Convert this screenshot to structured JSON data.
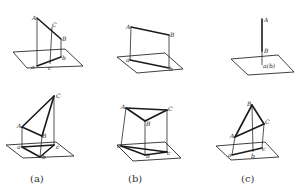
{
  "figure": {
    "width": 295,
    "height": 194,
    "background": "#ffffff",
    "ink_color": "#1a1a1a",
    "captions": [
      {
        "id": "a",
        "text": "(a)",
        "x": 30,
        "y": 182
      },
      {
        "id": "b",
        "text": "(b)",
        "x": 128,
        "y": 182
      },
      {
        "id": "c",
        "text": "(c)",
        "x": 241,
        "y": 182
      }
    ],
    "panels": [
      {
        "id": "top-a",
        "description": "Line AB with point C on it, projected onto horizontal plane as ab with c",
        "plane": [
          [
            13,
            52
          ],
          [
            65,
            49
          ],
          [
            83,
            66
          ],
          [
            27,
            68
          ]
        ],
        "edges": [
          [
            [
              37,
              18
            ],
            [
              61,
              39
            ]
          ],
          [
            [
              37,
              66
            ],
            [
              61,
              57
            ]
          ]
        ],
        "projectors": [
          [
            [
              37,
              18
            ],
            [
              37,
              66
            ]
          ],
          [
            [
              52,
              27
            ],
            [
              50,
              64
            ]
          ],
          [
            [
              61,
              39
            ],
            [
              61,
              57
            ]
          ]
        ],
        "labels": [
          {
            "text": "A",
            "x": 32,
            "y": 20
          },
          {
            "text": "C",
            "x": 52,
            "y": 27
          },
          {
            "text": "B",
            "x": 62,
            "y": 41
          },
          {
            "text": "a",
            "x": 31,
            "y": 69
          },
          {
            "text": "c",
            "x": 48,
            "y": 70
          },
          {
            "text": "b",
            "x": 62,
            "y": 60
          }
        ]
      },
      {
        "id": "top-b",
        "description": "Line AB and its projection ab",
        "plane": [
          [
            117,
            57
          ],
          [
            165,
            53
          ],
          [
            183,
            69
          ],
          [
            137,
            73
          ]
        ],
        "edges": [
          [
            [
              131,
              27
            ],
            [
              169,
              35
            ]
          ],
          [
            [
              130,
              60
            ],
            [
              169,
              68
            ]
          ]
        ],
        "projectors": [
          [
            [
              131,
              27
            ],
            [
              130,
              60
            ]
          ],
          [
            [
              169,
              35
            ],
            [
              169,
              68
            ]
          ]
        ],
        "labels": [
          {
            "text": "A",
            "x": 126,
            "y": 29
          },
          {
            "text": "B",
            "x": 170,
            "y": 37
          },
          {
            "text": "a",
            "x": 126,
            "y": 62
          },
          {
            "text": "b",
            "x": 169,
            "y": 71
          }
        ]
      },
      {
        "id": "top-c",
        "description": "Vertical line AB projecting to a single point a(b)",
        "plane": [
          [
            231,
            59
          ],
          [
            278,
            55
          ],
          [
            294,
            72
          ],
          [
            248,
            75
          ]
        ],
        "edges": [
          [
            [
              262,
              19
            ],
            [
              262,
              51
            ]
          ]
        ],
        "projectors": [
          [
            [
              262,
              51
            ],
            [
              262,
              65
            ]
          ]
        ],
        "labels": [
          {
            "text": "A",
            "x": 264,
            "y": 22
          },
          {
            "text": "B",
            "x": 264,
            "y": 53
          },
          {
            "text": "a(b)",
            "x": 263,
            "y": 68
          }
        ]
      },
      {
        "id": "bottom-a",
        "description": "Triangle ABC and its projection abc",
        "plane": [
          [
            6,
            145
          ],
          [
            56,
            142
          ],
          [
            74,
            156
          ],
          [
            23,
            158
          ]
        ],
        "edges": [
          [
            [
              54,
              96
            ],
            [
              22,
              127
            ]
          ],
          [
            [
              22,
              127
            ],
            [
              42,
              136
            ]
          ],
          [
            [
              42,
              136
            ],
            [
              54,
              96
            ]
          ],
          [
            [
              22,
              147
            ],
            [
              40,
              157
            ]
          ],
          [
            [
              40,
              157
            ],
            [
              54,
              145
            ]
          ],
          [
            [
              54,
              145
            ],
            [
              22,
              147
            ]
          ]
        ],
        "projectors": [
          [
            [
              22,
              127
            ],
            [
              22,
              147
            ]
          ],
          [
            [
              42,
              136
            ],
            [
              40,
              157
            ]
          ],
          [
            [
              54,
              96
            ],
            [
              54,
              145
            ]
          ]
        ],
        "labels": [
          {
            "text": "C",
            "x": 56,
            "y": 98
          },
          {
            "text": "A",
            "x": 17,
            "y": 128
          },
          {
            "text": "B",
            "x": 42,
            "y": 138
          },
          {
            "text": "a",
            "x": 17,
            "y": 149
          },
          {
            "text": "c",
            "x": 56,
            "y": 149
          },
          {
            "text": "b",
            "x": 42,
            "y": 159
          }
        ]
      },
      {
        "id": "bottom-b",
        "description": "Triangle ABC parallel to the plane, projection abc",
        "plane": [
          [
            117,
            145
          ],
          [
            165,
            142
          ],
          [
            181,
            158
          ],
          [
            133,
            161
          ]
        ],
        "edges": [
          [
            [
              126,
              108
            ],
            [
              167,
              110
            ]
          ],
          [
            [
              126,
              108
            ],
            [
              145,
              121
            ]
          ],
          [
            [
              145,
              121
            ],
            [
              167,
              110
            ]
          ],
          [
            [
              121,
              146
            ],
            [
              145,
              155
            ]
          ],
          [
            [
              145,
              155
            ],
            [
              167,
              152
            ]
          ],
          [
            [
              121,
              146
            ],
            [
              167,
              152
            ]
          ]
        ],
        "projectors": [
          [
            [
              126,
              108
            ],
            [
              121,
              146
            ]
          ],
          [
            [
              145,
              121
            ],
            [
              145,
              155
            ]
          ],
          [
            [
              167,
              110
            ],
            [
              167,
              152
            ]
          ]
        ],
        "labels": [
          {
            "text": "A",
            "x": 121,
            "y": 109
          },
          {
            "text": "C",
            "x": 168,
            "y": 111
          },
          {
            "text": "B",
            "x": 146,
            "y": 126
          },
          {
            "text": "a",
            "x": 117,
            "y": 148
          },
          {
            "text": "b",
            "x": 146,
            "y": 158
          },
          {
            "text": "c",
            "x": 167,
            "y": 155
          }
        ]
      },
      {
        "id": "bottom-c",
        "description": "Triangle ABC perpendicular to the plane, projecting to line abc",
        "plane": [
          [
            216,
            146
          ],
          [
            265,
            142
          ],
          [
            279,
            157
          ],
          [
            231,
            160
          ]
        ],
        "edges": [
          [
            [
              252,
              105
            ],
            [
              235,
              137
            ]
          ],
          [
            [
              235,
              137
            ],
            [
              264,
              124
            ]
          ],
          [
            [
              264,
              124
            ],
            [
              252,
              105
            ]
          ],
          [
            [
              232,
              155
            ],
            [
              262,
              148
            ]
          ]
        ],
        "projectors": [
          [
            [
              235,
              137
            ],
            [
              232,
              155
            ]
          ],
          [
            [
              252,
              105
            ],
            [
              253,
              152
            ]
          ],
          [
            [
              264,
              124
            ],
            [
              262,
              148
            ]
          ]
        ],
        "labels": [
          {
            "text": "B",
            "x": 247,
            "y": 106
          },
          {
            "text": "C",
            "x": 265,
            "y": 124
          },
          {
            "text": "A",
            "x": 230,
            "y": 138
          },
          {
            "text": "a",
            "x": 228,
            "y": 157
          },
          {
            "text": "b",
            "x": 251,
            "y": 158
          },
          {
            "text": "c",
            "x": 262,
            "y": 151
          }
        ]
      }
    ]
  }
}
